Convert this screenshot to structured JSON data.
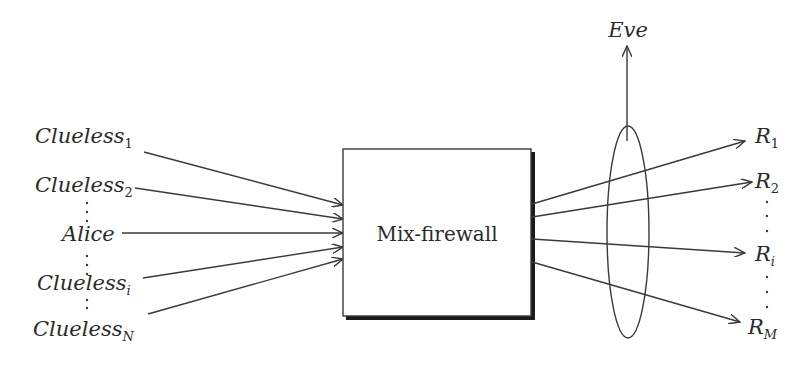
{
  "diagram": {
    "center_box": {
      "label": "Mix-firewall"
    },
    "observer": {
      "label": "Eve"
    },
    "senders": [
      {
        "name": "Clueless",
        "subscript": "1"
      },
      {
        "name": "Clueless",
        "subscript": "2"
      },
      {
        "name": "Alice",
        "subscript": ""
      },
      {
        "name": "Clueless",
        "subscript": "i"
      },
      {
        "name": "Clueless",
        "subscript": "N"
      }
    ],
    "receivers": [
      {
        "name": "R",
        "subscript": "1"
      },
      {
        "name": "R",
        "subscript": "2"
      },
      {
        "name": "R",
        "subscript": "i"
      },
      {
        "name": "R",
        "subscript": "M"
      }
    ],
    "ellipsis_glyph": "⋮",
    "colors": {
      "stroke": "#3a3a3a",
      "text": "#2a2a2a",
      "background": "#ffffff"
    }
  }
}
